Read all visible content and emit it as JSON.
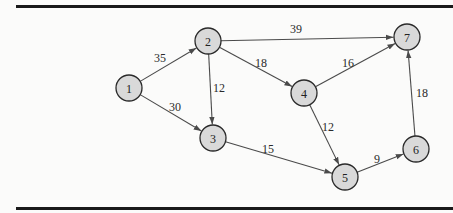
{
  "diagram": {
    "type": "directed-weighted-graph",
    "colors": {
      "node_fill": "#d9d9d9",
      "node_stroke": "#2a2a2a",
      "edge": "#4a4a4a",
      "rule": "#1a1a1a"
    },
    "nodes": [
      {
        "id": "1",
        "label": "1",
        "x": 129,
        "y": 88
      },
      {
        "id": "2",
        "label": "2",
        "x": 208,
        "y": 41
      },
      {
        "id": "3",
        "label": "3",
        "x": 213,
        "y": 138
      },
      {
        "id": "4",
        "label": "4",
        "x": 304,
        "y": 93
      },
      {
        "id": "5",
        "label": "5",
        "x": 345,
        "y": 177
      },
      {
        "id": "6",
        "label": "6",
        "x": 416,
        "y": 149
      },
      {
        "id": "7",
        "label": "7",
        "x": 407,
        "y": 37
      }
    ],
    "edges": [
      {
        "from": "1",
        "to": "2",
        "weight": "35",
        "lx": 160,
        "ly": 58
      },
      {
        "from": "1",
        "to": "3",
        "weight": "30",
        "lx": 175,
        "ly": 107
      },
      {
        "from": "2",
        "to": "3",
        "weight": "12",
        "lx": 219,
        "ly": 88
      },
      {
        "from": "2",
        "to": "4",
        "weight": "18",
        "lx": 261,
        "ly": 63
      },
      {
        "from": "2",
        "to": "7",
        "weight": "39",
        "lx": 296,
        "ly": 29
      },
      {
        "from": "3",
        "to": "5",
        "weight": "15",
        "lx": 268,
        "ly": 149
      },
      {
        "from": "4",
        "to": "7",
        "weight": "16",
        "lx": 348,
        "ly": 63
      },
      {
        "from": "4",
        "to": "5",
        "weight": "12",
        "lx": 328,
        "ly": 127
      },
      {
        "from": "5",
        "to": "6",
        "weight": "9",
        "lx": 377,
        "ly": 159
      },
      {
        "from": "6",
        "to": "7",
        "weight": "18",
        "lx": 422,
        "ly": 93
      }
    ]
  }
}
